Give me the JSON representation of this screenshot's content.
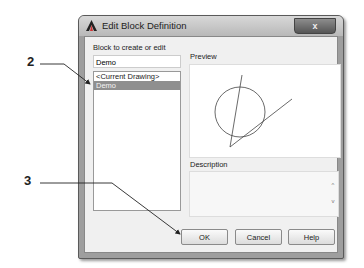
{
  "window": {
    "title": "Edit Block Definition",
    "close_label": "x"
  },
  "left_panel": {
    "label": "Block to create or edit",
    "name_value": "Demo",
    "list_items": [
      "<Current Drawing>",
      "Demo"
    ],
    "selected_index": 1
  },
  "preview": {
    "label": "Preview"
  },
  "description": {
    "label": "Description",
    "scroll_up": "^",
    "scroll_down": "v"
  },
  "buttons": {
    "ok": "OK",
    "cancel": "Cancel",
    "help": "Help"
  },
  "callouts": [
    {
      "number": "2",
      "target": "Demo list item"
    },
    {
      "number": "3",
      "target": "OK button"
    }
  ],
  "colors": {
    "selection": "#8f8f8f",
    "titlebar": "#c8c8c8",
    "frame": "#9e9e9e"
  }
}
